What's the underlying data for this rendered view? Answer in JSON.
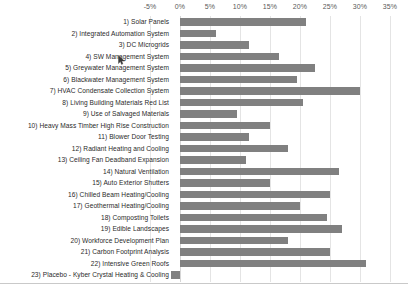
{
  "chart_data": {
    "type": "bar",
    "orientation": "horizontal",
    "title": "",
    "xlabel": "",
    "ylabel": "",
    "xlim": [
      -5,
      35
    ],
    "xticks": [
      -5,
      0,
      5,
      10,
      15,
      20,
      25,
      30,
      35
    ],
    "xtick_labels": [
      "-5%",
      "0%",
      "5%",
      "10%",
      "15%",
      "20%",
      "25%",
      "30%",
      "35%"
    ],
    "grid": true,
    "legend": "none",
    "bar_color": "#808080",
    "categories": [
      "1) Solar Panels",
      "2) Integrated Automation System",
      "3) DC Microgrids",
      "4) SW Management System",
      "5) Greywater Management System",
      "6) Blackwater Management System",
      "7) HVAC Condensate Collection System",
      "8) Living Building Materials Red List",
      "9) Use of Salvaged Materials",
      "10) Heavy Mass Timber High Rise Construction",
      "11) Blower Door Testing",
      "12) Radiant Heating and Cooling",
      "13) Ceiling Fan Deadband Expansion",
      "14) Natural Ventilation",
      "15) Auto Exterior Shutters",
      "16) Chilled Beam Heating/Cooling",
      "17) Geothermal Heating/Cooling",
      "18) Composting Toilets",
      "19) Edible Landscapes",
      "20) Workforce Development Plan",
      "21) Carbon Footprint Analysis",
      "22) Intensive Green Roofs",
      "23) Placebo - Kyber Crystal Heating & Cooling"
    ],
    "values": [
      21.0,
      6.0,
      11.5,
      16.5,
      22.5,
      19.5,
      30.0,
      20.5,
      9.5,
      15.0,
      11.5,
      18.0,
      11.0,
      26.5,
      15.0,
      25.0,
      20.0,
      24.5,
      27.0,
      18.0,
      25.0,
      31.0,
      -1.5
    ]
  }
}
